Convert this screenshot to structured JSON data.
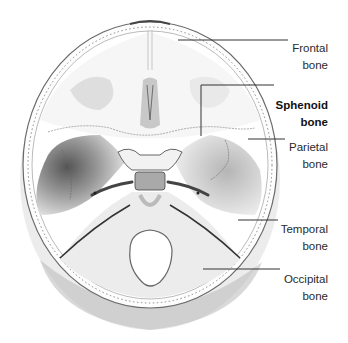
{
  "figure": {
    "labels": [
      {
        "id": "frontal",
        "line1": "Frontal",
        "line2": "bone",
        "bold": false
      },
      {
        "id": "sphenoid",
        "line1": "Sphenoid",
        "line2": "bone",
        "bold": true
      },
      {
        "id": "parietal",
        "line1": "Parietal",
        "line2": "bone",
        "bold": false
      },
      {
        "id": "temporal",
        "line1": "Temporal",
        "line2": "bone",
        "bold": false
      },
      {
        "id": "occipital",
        "line1": "Occipital",
        "line2": "bone",
        "bold": false
      }
    ]
  },
  "colors": {
    "background": "#ffffff",
    "leader_line": "#333333",
    "label_text": "#2a2a2a",
    "bone_shade": "#9a9a9a"
  }
}
